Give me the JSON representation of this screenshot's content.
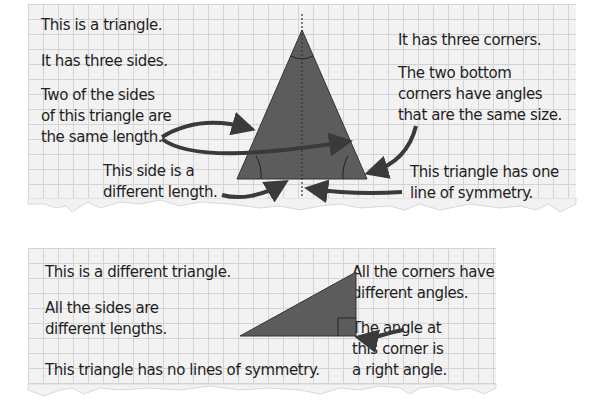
{
  "panel_top": {
    "left_texts": [
      "This is a triangle.",
      "It has three sides.",
      "Two of the sides",
      "of this triangle are",
      "the same length."
    ],
    "bottom_left_text": [
      "This side is a",
      "different length."
    ],
    "right_texts": [
      "It has three corners.",
      "The two bottom",
      "corners have angles",
      "that are the same size."
    ],
    "bottom_right_text": [
      "This triangle has one",
      "line of symmetry."
    ]
  },
  "panel_bottom": {
    "left_texts": [
      "This is a different triangle.",
      "All the sides are",
      "different lengths.",
      "This triangle has no lines of symmetry."
    ],
    "right_texts": [
      "All the corners have",
      "different angles.",
      "The angle at",
      "this corner is",
      "a right angle."
    ]
  },
  "colors": {
    "triangle_fill": "#5c5c5c",
    "arrow": "#3a3a3a",
    "grid_line": "#d4d4d4",
    "paper": "#f2f2f2"
  }
}
